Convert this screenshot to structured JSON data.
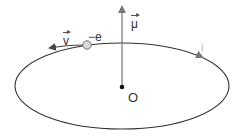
{
  "diagram": {
    "labels": {
      "velocity": "v",
      "charge": "−e",
      "moment": "μ",
      "origin": "O",
      "current": "i"
    },
    "colors": {
      "orbit": "#333333",
      "axis": "#777777",
      "electron_fill": "#d9d9d9",
      "electron_stroke": "#777777",
      "origin_dot": "#111111",
      "current_arrow": "#999999"
    }
  }
}
